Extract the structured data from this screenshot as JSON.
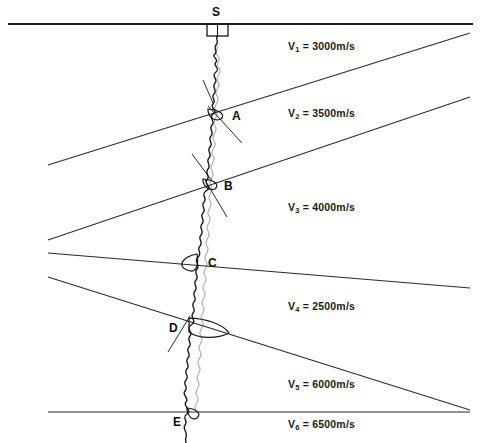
{
  "figure": {
    "type": "vertical-seismic-profile-diagram",
    "width": 481,
    "height": 443,
    "background_color": "#ffffff",
    "line_color": "#222222",
    "trace_color": "#1a1a1a"
  },
  "source": {
    "label": "S",
    "marker": "source-box",
    "x": 217,
    "y": 16
  },
  "surface": {
    "name": "ground-surface-line",
    "y": 24
  },
  "layers": [
    {
      "id": "v1",
      "label_prefix": "V",
      "subscript": "1",
      "equals": " = ",
      "value": "3000",
      "unit": "m/s",
      "text": "V1 = 3000 m/s",
      "x": 288,
      "y": 46
    },
    {
      "id": "v2",
      "label_prefix": "V",
      "subscript": "2",
      "equals": " = ",
      "value": "3500",
      "unit": "m/s",
      "text": "V2 = 3500 m/s",
      "x": 288,
      "y": 113
    },
    {
      "id": "v3",
      "label_prefix": "V",
      "subscript": "3",
      "equals": " = ",
      "value": "4000",
      "unit": "m/s",
      "text": "V3 = 4000 m/s",
      "x": 288,
      "y": 207
    },
    {
      "id": "v4",
      "label_prefix": "V",
      "subscript": "4",
      "equals": " = ",
      "value": "2500",
      "unit": "m/s",
      "text": "V4 = 2500 m/s",
      "x": 288,
      "y": 306
    },
    {
      "id": "v5",
      "label_prefix": "V",
      "subscript": "5",
      "equals": " = ",
      "value": "6000",
      "unit": "m/s",
      "text": "V5 = 6000m/s",
      "x": 288,
      "y": 384
    },
    {
      "id": "v6",
      "label_prefix": "V",
      "subscript": "6",
      "equals": " = ",
      "value": "6500",
      "unit": "m/s",
      "text": "V6 = 6500m/s",
      "x": 288,
      "y": 424
    }
  ],
  "interfaces": [
    {
      "id": "interface-1",
      "x1": 48,
      "y1": 165,
      "x2": 470,
      "y2": 33,
      "dip": "up-to-right"
    },
    {
      "id": "interface-2",
      "x1": 48,
      "y1": 240,
      "x2": 470,
      "y2": 97,
      "dip": "up-to-right"
    },
    {
      "id": "interface-3",
      "x1": 48,
      "y1": 253,
      "x2": 470,
      "y2": 288,
      "dip": "down-to-right"
    },
    {
      "id": "interface-4",
      "x1": 48,
      "y1": 277,
      "x2": 470,
      "y2": 410,
      "dip": "down-to-right"
    },
    {
      "id": "interface-5",
      "x1": 48,
      "y1": 412,
      "x2": 470,
      "y2": 412,
      "dip": "horizontal"
    }
  ],
  "reflection_points": [
    {
      "id": "point-a",
      "label": "A",
      "x": 236,
      "y": 116,
      "trace_x": 212,
      "trace_y": 114
    },
    {
      "id": "point-b",
      "label": "B",
      "x": 228,
      "y": 186,
      "trace_x": 207,
      "trace_y": 184
    },
    {
      "id": "point-c",
      "label": "C",
      "x": 210,
      "y": 265,
      "trace_x": 196,
      "trace_y": 262
    },
    {
      "id": "point-d",
      "label": "D",
      "x": 172,
      "y": 330,
      "trace_x": 190,
      "trace_y": 328
    },
    {
      "id": "point-e",
      "label": "E",
      "x": 176,
      "y": 424,
      "trace_x": 188,
      "trace_y": 414
    }
  ],
  "borehole_trace": {
    "name": "seismic-wiggle-trace",
    "description": "vertical noisy seismic trace from source down the borehole",
    "top_x": 217,
    "top_y": 36,
    "bottom_x": 187,
    "bottom_y": 440
  }
}
